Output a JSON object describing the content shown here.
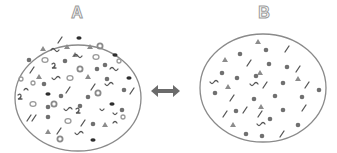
{
  "diagram": {
    "title": "",
    "panels": [
      {
        "label": "A",
        "description": "Mixture with many particle types: filled dots, dark ovals, rings, triangles, line segments, squiggles, hooks"
      },
      {
        "label": "B",
        "description": "Mixture with fewer particle types: filled dots, triangles, line segments, few squiggles"
      }
    ],
    "connector": {
      "type": "double-headed-arrow",
      "color": "#6b6b6b"
    },
    "colors": {
      "outline": "#8a8a8a",
      "dot": "#707070",
      "dark": "#2e2e2e",
      "triangle": "#8c8c8c",
      "ring": "#8a8a8a"
    }
  }
}
